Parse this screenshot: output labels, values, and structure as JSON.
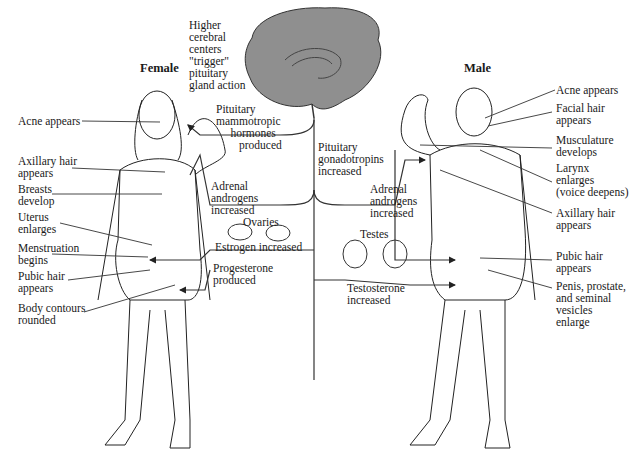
{
  "titles": {
    "female": "Female",
    "male": "Male"
  },
  "center": {
    "brain_caption": "Higher\ncerebral\ncenters\n\"trigger\"\npituitary\ngland action",
    "pituitary_mammotropic": "Pituitary\nmammotropic\n     hormones\n        produced",
    "pituitary_gonadotropins": "Pituitary\ngonadotropins\nincreased",
    "adrenal_female": "Adrenal\nandrogens\nincreased",
    "adrenal_male": "Adrenal\nandrogens\nincreased",
    "ovaries": "Ovaries",
    "estrogen": "Estrogen increased",
    "progesterone": "Progesterone\nproduced",
    "testes": "Testes",
    "testosterone": "Testosterone\nincreased"
  },
  "female_labels": [
    "Acne appears",
    "Axillary hair\nappears",
    "Breasts\ndevelop",
    "Uterus\nenlarges",
    "Menstruation\nbegins",
    "Pubic hair\nappears",
    "Body contours\nrounded"
  ],
  "male_labels": [
    "Acne appears",
    "Facial hair\nappears",
    "Musculature\ndevelops",
    "Larynx\nenlarges\n(voice deepens)",
    "Axillary hair\nappears",
    "Pubic hair\nappears",
    "Penis, prostate,\nand seminal\nvesicles\nenlarge"
  ]
}
